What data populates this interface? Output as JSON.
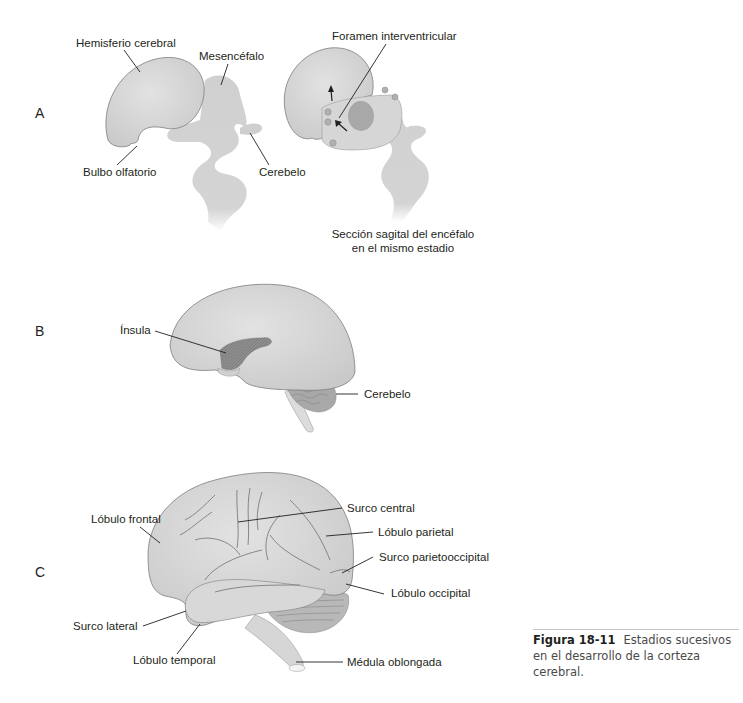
{
  "figure": {
    "number": "Figura 18-11",
    "caption": "Estadios sucesivos en el desarrollo de la corteza cerebral.",
    "panels": {
      "A": {
        "letter": "A",
        "labels": {
          "hemisferio": "Hemisferio cerebral",
          "mesencefalo": "Mesencéfalo",
          "bulbo": "Bulbo olfatorio",
          "cerebelo": "Cerebelo",
          "foramen": "Foramen interventricular",
          "seccion_line1": "Sección sagital del encéfalo",
          "seccion_line2": "en el mismo estadio"
        }
      },
      "B": {
        "letter": "B",
        "labels": {
          "insula": "Ínsula",
          "cerebelo": "Cerebelo"
        }
      },
      "C": {
        "letter": "C",
        "labels": {
          "lobulo_frontal": "Lóbulo frontal",
          "surco_central": "Surco central",
          "lobulo_parietal": "Lóbulo parietal",
          "surco_parietooccipital": "Surco parietooccipital",
          "lobulo_occipital": "Lóbulo occipital",
          "surco_lateral": "Surco lateral",
          "lobulo_temporal": "Lóbulo temporal",
          "medula": "Médula oblongada"
        }
      }
    },
    "colors": {
      "tissue": "#d4d4d4",
      "tissue_dark": "#9a9a9a",
      "outline": "#8c8c8c",
      "leader": "#231f20"
    }
  }
}
